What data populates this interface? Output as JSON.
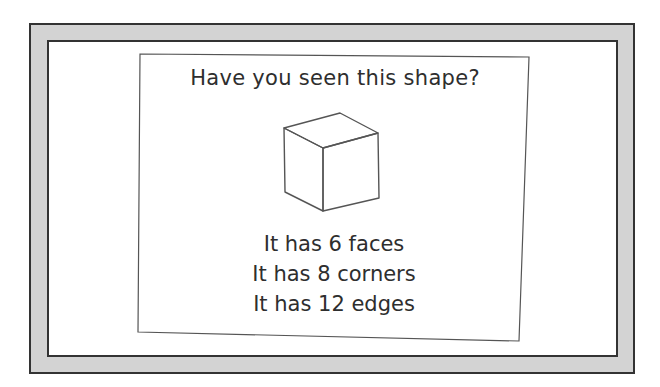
{
  "card": {
    "title": "Have you seen this shape?",
    "shape_icon": "cube-icon",
    "facts": [
      "It has 6 faces",
      "It has 8 corners",
      "It has 12 edges"
    ]
  },
  "colors": {
    "frame": "#d3d3d3",
    "border": "#333333",
    "text": "#2e2e2e",
    "line": "#555555"
  }
}
